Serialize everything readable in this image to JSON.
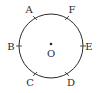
{
  "diagram": {
    "type": "circle-with-points",
    "center": {
      "label": "O",
      "x": 51,
      "y": 46
    },
    "radius": 32,
    "points": [
      {
        "label": "A",
        "x": 35,
        "y": 18,
        "lx": 28,
        "ly": 13
      },
      {
        "label": "F",
        "x": 67,
        "y": 18,
        "lx": 71,
        "ly": 13
      },
      {
        "label": "B",
        "x": 19,
        "y": 46,
        "lx": 11,
        "ly": 50
      },
      {
        "label": "E",
        "x": 83,
        "y": 46,
        "lx": 88,
        "ly": 50
      },
      {
        "label": "C",
        "x": 35,
        "y": 74,
        "lx": 30,
        "ly": 86
      },
      {
        "label": "D",
        "x": 67,
        "y": 74,
        "lx": 71,
        "ly": 86
      }
    ],
    "colors": {
      "stroke": "#2a2a2a",
      "background": "#ffffff"
    }
  }
}
